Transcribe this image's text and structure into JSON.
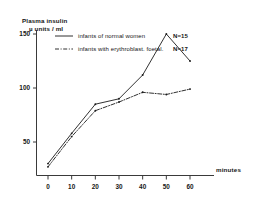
{
  "chart_data": {
    "type": "line",
    "title": "",
    "xlabel": "minutes",
    "ylabel": "Plasma insulin",
    "ylabel_line1": "Plasma insulin",
    "ylabel_line2": "µ units / ml",
    "x": [
      0,
      10,
      20,
      30,
      40,
      50,
      60
    ],
    "xticklabels": [
      "0",
      "10",
      "20",
      "30",
      "40",
      "50",
      "60"
    ],
    "yticklabels": [
      "50",
      "100",
      "150"
    ],
    "yticks": [
      50,
      100,
      150
    ],
    "xlim": [
      -3,
      63
    ],
    "ylim": [
      0,
      157
    ],
    "grid": false,
    "legend_position": "upper-left-inside",
    "series": [
      {
        "name": "infants of normal women",
        "n_label": "N=15",
        "style": "solid",
        "color": "#1a1a1a",
        "values": [
          30,
          58,
          85,
          90,
          112,
          150,
          125
        ]
      },
      {
        "name": "infants with erythroblast. foetal.",
        "n_label": "N=17",
        "style": "dash-dot",
        "color": "#1a1a1a",
        "values": [
          27,
          55,
          79,
          87,
          96,
          94,
          99
        ]
      }
    ]
  },
  "axes": {
    "x_axis_title": "minutes",
    "y_axis_title_line1": "Plasma insulin",
    "y_axis_title_line2": "µ units / ml"
  },
  "legend": {
    "entries": [
      {
        "label": "infants of normal women",
        "count": "N=15"
      },
      {
        "label": "infants with erythroblast. foetal.",
        "count": "N=17"
      }
    ]
  },
  "colors": {
    "ink": "#1a1a1a",
    "axis": "#3a3a3a",
    "background": "#ffffff"
  }
}
